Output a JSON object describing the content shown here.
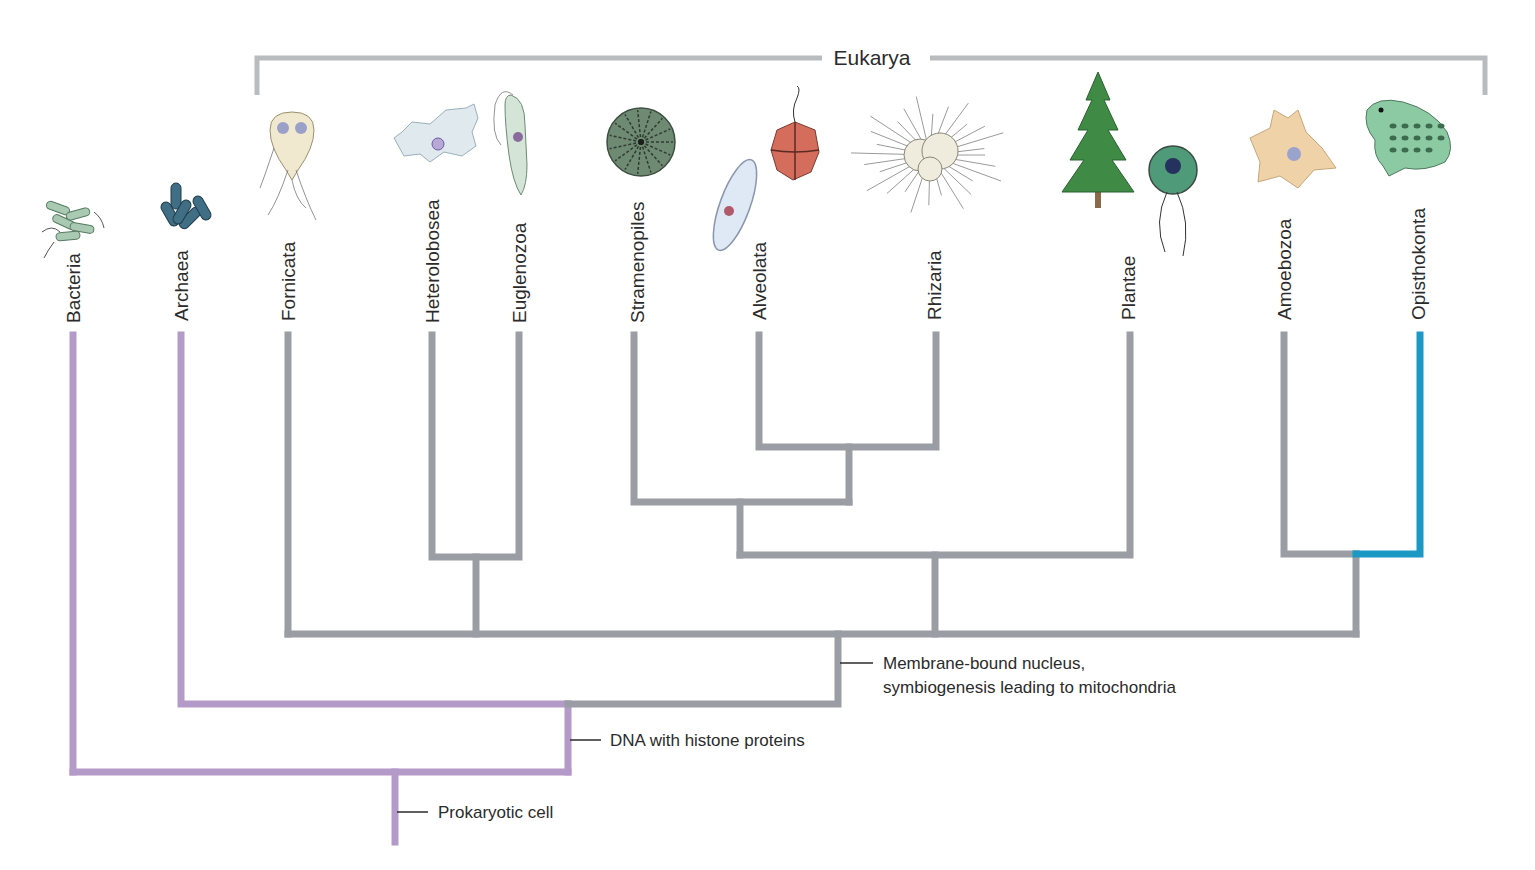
{
  "diagram": {
    "type": "phylogenetic-tree",
    "colors": {
      "prokaryote_branch": "#b39ac8",
      "eukaryote_branch": "#9a9ea4",
      "opisthokonta_branch": "#1b98c4",
      "bracket": "#b8bcbf",
      "text": "#2b2b2b",
      "tick": "#2b2b2b"
    },
    "bracket": {
      "label": "Eukarya",
      "x1": 257,
      "x2": 1485,
      "y": 58,
      "drop_to": 95,
      "label_x": 872,
      "label_gap_left": 822,
      "label_gap_right": 930
    },
    "taxa": [
      {
        "id": "bacteria",
        "label": "Bacteria",
        "x": 73,
        "label_bottom": 323,
        "color": "prokaryote"
      },
      {
        "id": "archaea",
        "label": "Archaea",
        "x": 181,
        "label_bottom": 321,
        "color": "prokaryote"
      },
      {
        "id": "fornicata",
        "label": "Fornicata",
        "x": 288,
        "label_bottom": 321,
        "color": "eukaryote"
      },
      {
        "id": "heterolobosea",
        "label": "Heterolobosea",
        "x": 432,
        "label_bottom": 323,
        "color": "eukaryote"
      },
      {
        "id": "euglenozoa",
        "label": "Euglenozoa",
        "x": 519,
        "label_bottom": 323,
        "color": "eukaryote"
      },
      {
        "id": "stramenopiles",
        "label": "Stramenopiles",
        "x": 637,
        "label_bottom": 323,
        "color": "eukaryote"
      },
      {
        "id": "alveolata",
        "label": "Alveolata",
        "x": 759,
        "label_bottom": 320,
        "color": "eukaryote"
      },
      {
        "id": "rhizaria",
        "label": "Rhizaria",
        "x": 934,
        "label_bottom": 320,
        "color": "eukaryote"
      },
      {
        "id": "plantae",
        "label": "Plantae",
        "x": 1128,
        "label_bottom": 320,
        "color": "eukaryote"
      },
      {
        "id": "amoebozoa",
        "label": "Amoebozoa",
        "x": 1284,
        "label_bottom": 320,
        "color": "eukaryote"
      },
      {
        "id": "opisthokonta",
        "label": "Opisthokonta",
        "x": 1418,
        "label_bottom": 320,
        "color": "opisthokonta"
      }
    ],
    "branches": [
      {
        "id": "bacteria-stem",
        "color": "prokaryote",
        "points": [
          [
            73,
            335
          ],
          [
            73,
            772
          ]
        ]
      },
      {
        "id": "root-horizontal",
        "color": "prokaryote",
        "points": [
          [
            73,
            772
          ],
          [
            568,
            772
          ]
        ]
      },
      {
        "id": "archaea-euk-stem",
        "color": "prokaryote",
        "points": [
          [
            568,
            772
          ],
          [
            568,
            704
          ]
        ]
      },
      {
        "id": "archaea-stem",
        "color": "prokaryote",
        "points": [
          [
            181,
            335
          ],
          [
            181,
            704
          ],
          [
            568,
            704
          ]
        ]
      },
      {
        "id": "root-stem",
        "color": "prokaryote",
        "points": [
          [
            395,
            772
          ],
          [
            395,
            842
          ]
        ]
      },
      {
        "id": "euk-link",
        "color": "eukaryote",
        "points": [
          [
            568,
            704
          ],
          [
            838,
            704
          ],
          [
            838,
            634
          ]
        ]
      },
      {
        "id": "euk-main-horizontal",
        "color": "eukaryote",
        "points": [
          [
            288,
            634
          ],
          [
            1356,
            634
          ]
        ]
      },
      {
        "id": "fornicata-stem",
        "color": "eukaryote",
        "points": [
          [
            288,
            335
          ],
          [
            288,
            634
          ]
        ]
      },
      {
        "id": "hetero-eugl-stem",
        "color": "eukaryote",
        "points": [
          [
            476,
            634
          ],
          [
            476,
            557
          ]
        ]
      },
      {
        "id": "hetero-eugl-bar",
        "color": "eukaryote",
        "points": [
          [
            432,
            335
          ],
          [
            432,
            557
          ],
          [
            519,
            557
          ],
          [
            519,
            335
          ]
        ]
      },
      {
        "id": "sar-plantae-stem",
        "color": "eukaryote",
        "points": [
          [
            935,
            634
          ],
          [
            935,
            555
          ]
        ]
      },
      {
        "id": "sar-plantae-bar",
        "color": "eukaryote",
        "points": [
          [
            740,
            555
          ],
          [
            1130,
            555
          ],
          [
            1130,
            335
          ]
        ]
      },
      {
        "id": "sar-stem",
        "color": "eukaryote",
        "points": [
          [
            740,
            555
          ],
          [
            740,
            502
          ]
        ]
      },
      {
        "id": "sar-bar",
        "color": "eukaryote",
        "points": [
          [
            634,
            335
          ],
          [
            634,
            502
          ],
          [
            849,
            502
          ]
        ]
      },
      {
        "id": "alv-rhiz-stem",
        "color": "eukaryote",
        "points": [
          [
            849,
            502
          ],
          [
            849,
            447
          ]
        ]
      },
      {
        "id": "alv-rhiz-bar",
        "color": "eukaryote",
        "points": [
          [
            759,
            335
          ],
          [
            759,
            447
          ],
          [
            936,
            447
          ],
          [
            936,
            335
          ]
        ]
      },
      {
        "id": "amorphea-stem",
        "color": "eukaryote",
        "points": [
          [
            1356,
            634
          ],
          [
            1356,
            554
          ]
        ]
      },
      {
        "id": "amoebozoa-bar",
        "color": "eukaryote",
        "points": [
          [
            1284,
            335
          ],
          [
            1284,
            554
          ],
          [
            1356,
            554
          ]
        ]
      },
      {
        "id": "opisthokonta-bar",
        "color": "opisthokonta",
        "points": [
          [
            1356,
            554
          ],
          [
            1420,
            554
          ],
          [
            1420,
            335
          ]
        ]
      }
    ],
    "traits": [
      {
        "id": "prokaryotic-cell",
        "lines": [
          "Prokaryotic cell"
        ],
        "tick_x1": 397,
        "tick_x2": 428,
        "y": 812,
        "text_x": 438
      },
      {
        "id": "histone-dna",
        "lines": [
          "DNA with histone proteins"
        ],
        "tick_x1": 570,
        "tick_x2": 601,
        "y": 740,
        "text_x": 610
      },
      {
        "id": "membrane-nucleus",
        "lines": [
          "Membrane-bound nucleus,",
          "symbiogenesis leading to mitochondria"
        ],
        "tick_x1": 840,
        "tick_x2": 873,
        "y": 663,
        "text_x": 883,
        "line_height": 24
      }
    ],
    "organism_icons": [
      {
        "taxon": "bacteria",
        "name": "rod-bacteria-icon",
        "cx": 72,
        "cy": 222
      },
      {
        "taxon": "archaea",
        "name": "rod-archaea-icon",
        "cx": 184,
        "cy": 208
      },
      {
        "taxon": "fornicata",
        "name": "giardia-icon",
        "cx": 292,
        "cy": 150
      },
      {
        "taxon": "heterolobosea",
        "name": "naegleria-amoeba-icon",
        "cx": 434,
        "cy": 138
      },
      {
        "taxon": "euglenozoa",
        "name": "euglena-icon",
        "cx": 515,
        "cy": 145
      },
      {
        "taxon": "stramenopiles",
        "name": "diatom-icon",
        "cx": 641,
        "cy": 142
      },
      {
        "taxon": "alveolata",
        "name": "paramecium-icon",
        "cx": 735,
        "cy": 205
      },
      {
        "taxon": "alveolata",
        "name": "dinoflagellate-icon",
        "cx": 795,
        "cy": 150
      },
      {
        "taxon": "rhizaria",
        "name": "radiolarian-icon",
        "cx": 930,
        "cy": 155
      },
      {
        "taxon": "plantae",
        "name": "pine-tree-icon",
        "cx": 1098,
        "cy": 140
      },
      {
        "taxon": "plantae",
        "name": "chlamydomonas-icon",
        "cx": 1173,
        "cy": 190
      },
      {
        "taxon": "amoebozoa",
        "name": "amoeba-icon",
        "cx": 1290,
        "cy": 150
      },
      {
        "taxon": "opisthokonta",
        "name": "frog-icon",
        "cx": 1413,
        "cy": 140
      }
    ]
  }
}
